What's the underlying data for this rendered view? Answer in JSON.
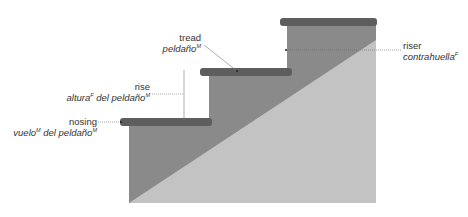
{
  "colors": {
    "riser_fill": "#8a8a8a",
    "tread_fill": "#5e5e5e",
    "underside_fill": "#c3c3c3",
    "leader_line": "#666666",
    "text": "#333333"
  },
  "labels": {
    "tread": {
      "en": "tread",
      "es": "peldaño",
      "es_sup": "M"
    },
    "riser": {
      "en": "riser",
      "es": "contrahuella",
      "es_sup": "F"
    },
    "rise": {
      "en": "rise",
      "es_part1": "altura",
      "es_sup1": "F",
      "es_part2": " del peldaño",
      "es_sup2": "M"
    },
    "nosing": {
      "en": "nosing",
      "es_part1": "vuelo",
      "es_sup1": "M",
      "es_part2": " del peldaño",
      "es_sup2": "M"
    }
  }
}
